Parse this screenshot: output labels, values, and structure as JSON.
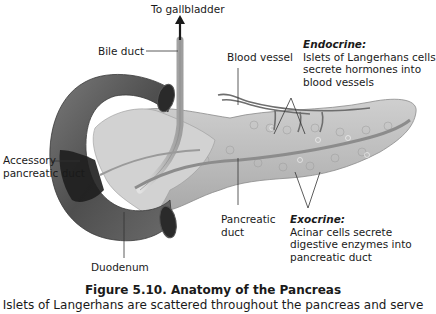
{
  "figure": {
    "title": "Figure 5.10.  Anatomy of the Pancreas",
    "caption": "Islets of Langerhans are scattered throughout the pancreas and serve"
  },
  "labels": {
    "to_gallbladder": "To gallbladder",
    "bile_duct": "Bile duct",
    "blood_vessel": "Blood vessel",
    "accessory_duct_line1": "Accessory",
    "accessory_duct_line2": "pancreatic duct",
    "duodenum": "Duodenum",
    "pancreatic_duct_line1": "Pancreatic",
    "pancreatic_duct_line2": "duct",
    "endocrine": {
      "heading": "Endocrine:",
      "line1": "Islets of Langerhans cells",
      "line2": "secrete hormones into",
      "line3": "blood vessels"
    },
    "exocrine": {
      "heading": "Exocrine:",
      "line1": "Acinar cells secrete",
      "line2": "digestive enzymes into",
      "line3": "pancreatic duct"
    }
  },
  "colors": {
    "duodenum": "#5a5a5a",
    "duodenum_dark": "#1e1e1e",
    "pancreas": "#bdbdbd",
    "pancreas_light": "#d9d9d9",
    "duct": "#9a9a9a",
    "vessel": "#6e6e6e",
    "leader_line": "#333333"
  }
}
